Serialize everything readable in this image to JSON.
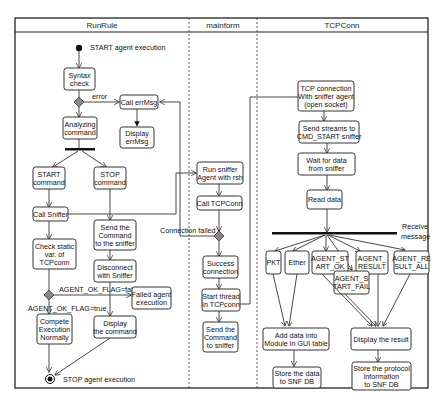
{
  "lanes": [
    {
      "id": "runrule",
      "title": "RunRule"
    },
    {
      "id": "mainform",
      "title": "mainform"
    },
    {
      "id": "tcpconn",
      "title": "TCPConn"
    }
  ],
  "labels": {
    "start": "START agent execution",
    "stop": "STOP agent execution",
    "error": "error",
    "connection_failed": "Connection failed",
    "flag_false": "AGENT_OK_FLAG=false",
    "flag_true": "AGENT_OK_FLAG=true",
    "receive_message": [
      "Receive",
      "message"
    ]
  },
  "nodes": {
    "syntax_check": [
      "Syntax",
      "check"
    ],
    "call_errmsg": [
      "Call errMsg"
    ],
    "display_errmsg": [
      "Display",
      "errMsg"
    ],
    "analyzing_command": [
      "Analyzing",
      "command"
    ],
    "start_command": [
      "START",
      "command"
    ],
    "stop_command": [
      "STOP",
      "command"
    ],
    "call_sniffer": [
      "Call Sniffer"
    ],
    "send_command_sniffer": [
      "Send the",
      "Command",
      "to the sniffer"
    ],
    "check_static": [
      "Check static",
      "var. of",
      "TCPconn"
    ],
    "disconnect": [
      "Disconnect",
      "with Sniffer"
    ],
    "failed_agent": [
      "Failed agent",
      "execution"
    ],
    "compete_execution": [
      "Compete",
      "Execution",
      "Normally"
    ],
    "display_command": [
      "Display",
      "the command"
    ],
    "run_sniffer": [
      "Run sniffer",
      "Agent with rsh"
    ],
    "call_tcpconn": [
      "Call TCPConn"
    ],
    "success_connection": [
      "Success",
      "connection"
    ],
    "start_thread": [
      "Start thread",
      "in TCPconn"
    ],
    "send_command_to_sniffer": [
      "Send the",
      "Command",
      "to sniffer"
    ],
    "tcp_connection": [
      "TCP connection",
      "With sniffer agent",
      "(open socket)"
    ],
    "send_streams": [
      "Send streams to",
      "CMD_START sniffer"
    ],
    "wait_for_data": [
      "Wait for data",
      "from sniffer"
    ],
    "read_data": [
      "Read data"
    ],
    "pkt": [
      "PKT"
    ],
    "ether": [
      "Ether"
    ],
    "agent_start_ok": [
      "AGENT_ST",
      "ART_OK"
    ],
    "agent_result": [
      "AGENT_",
      "RESULT"
    ],
    "agent_result_all": [
      "AGENT_RE",
      "SULT_ALL"
    ],
    "agent_start_fail": [
      "AGENT_S",
      "TART_FAIL"
    ],
    "add_data_gui": [
      "Add data into",
      "Module in GUI table"
    ],
    "display_result": [
      "Display the result"
    ],
    "store_data_snf": [
      "Store the data",
      "to SNF DB"
    ],
    "store_protocol": [
      "Store the protocol",
      "information",
      "to SNF DB"
    ]
  }
}
